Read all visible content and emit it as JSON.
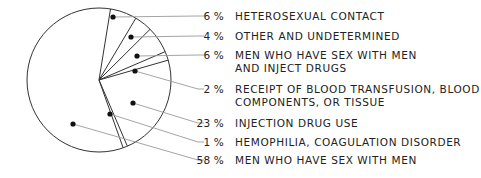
{
  "chart_data": {
    "type": "pie",
    "title": "",
    "start_angle_deg": -80.8,
    "direction": "clockwise",
    "center": [
      99,
      80
    ],
    "radius": 72,
    "slices": [
      {
        "label": "HETEROSEXUAL CONTACT",
        "value": 6,
        "pct_text": "6 %",
        "label_lines": [
          "HETEROSEXUAL CONTACT"
        ],
        "label_y": 19,
        "dot": [
          113,
          17
        ]
      },
      {
        "label": "OTHER AND UNDETERMINED",
        "value": 4,
        "pct_text": "4 %",
        "label_lines": [
          "OTHER AND UNDETERMINED"
        ],
        "label_y": 39,
        "dot": [
          131,
          37
        ]
      },
      {
        "label": "MEN WHO HAVE SEX WITH MEN AND INJECT DRUGS",
        "value": 6,
        "pct_text": "6 %",
        "label_lines": [
          "MEN WHO HAVE SEX WITH MEN",
          "AND INJECT DRUGS"
        ],
        "label_y": 58,
        "dot": [
          137,
          56
        ]
      },
      {
        "label": "RECEIPT OF BLOOD TRANSFUSION, BLOOD COMPONENTS, OR TISSUE",
        "value": 2,
        "pct_text": "2 %",
        "label_lines": [
          "RECEIPT OF BLOOD TRANSFUSION, BLOOD",
          "COMPONENTS, OR TISSUE"
        ],
        "label_y": 92,
        "dot": [
          135,
          71
        ]
      },
      {
        "label": "INJECTION DRUG USE",
        "value": 23,
        "pct_text": "23 %",
        "label_lines": [
          "INJECTION DRUG USE"
        ],
        "label_y": 126,
        "dot": [
          133,
          103
        ]
      },
      {
        "label": "HEMOPHILIA, COAGULATION DISORDER",
        "value": 1,
        "pct_text": "1 %",
        "label_lines": [
          "HEMOPHILIA, COAGULATION DISORDER"
        ],
        "label_y": 145,
        "dot": [
          110,
          114
        ]
      },
      {
        "label": "MEN WHO HAVE SEX WITH MEN",
        "value": 58,
        "pct_text": "58 %",
        "label_lines": [
          "MEN WHO HAVE SEX WITH MEN"
        ],
        "label_y": 163,
        "dot": [
          73,
          124
        ]
      }
    ],
    "legend_position": "right",
    "grid": false
  },
  "colors": {
    "stroke": "#333333",
    "leader": "#9a9a9a",
    "dot": "#111111",
    "fill": "#ffffff"
  }
}
